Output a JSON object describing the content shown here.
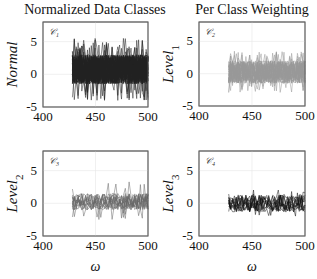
{
  "figure": {
    "titles": [
      "Normalized Data Classes",
      "Per Class Weighting"
    ]
  },
  "chart_data": [
    {
      "type": "line",
      "panel": "top-left",
      "title": "Normalized Data Classes",
      "annotation": "C1",
      "ylabel": "Normal",
      "ylabel_sub": "",
      "xlabel": "",
      "xlim": [
        400,
        500
      ],
      "ylim": [
        -5,
        8
      ],
      "xticks": [
        400,
        450,
        500
      ],
      "yticks": [
        -5,
        0,
        5
      ],
      "grid": true,
      "series_color": "#222222",
      "series_count": 60,
      "x_range": [
        428,
        500
      ],
      "band": {
        "low": -1.5,
        "high": 3.0
      },
      "outliers": {
        "max": 5.5,
        "min": -4.0
      }
    },
    {
      "type": "line",
      "panel": "top-right",
      "title": "Per Class Weighting",
      "annotation": "C2",
      "ylabel": "Level",
      "ylabel_sub": "1",
      "xlabel": "",
      "xlim": [
        400,
        500
      ],
      "ylim": [
        -5,
        8
      ],
      "xticks": [
        400,
        450,
        500
      ],
      "yticks": [
        -5,
        0,
        5
      ],
      "grid": true,
      "series_color": "#999999",
      "series_count": 40,
      "x_range": [
        428,
        500
      ],
      "band": {
        "low": -1.5,
        "high": 2.0
      },
      "outliers": {
        "max": 3.5,
        "min": -3.0
      }
    },
    {
      "type": "line",
      "panel": "bottom-left",
      "title": "",
      "annotation": "C3",
      "ylabel": "Level",
      "ylabel_sub": "2",
      "xlabel": "ω",
      "xlim": [
        400,
        500
      ],
      "ylim": [
        -5,
        8
      ],
      "xticks": [
        400,
        450,
        500
      ],
      "yticks": [
        -5,
        0,
        5
      ],
      "grid": true,
      "series_color": "#666666",
      "series_count": 14,
      "x_range": [
        428,
        500
      ],
      "band": {
        "low": -1.0,
        "high": 1.5
      },
      "outliers": {
        "max": 3.3,
        "min": -2.5
      }
    },
    {
      "type": "line",
      "panel": "bottom-right",
      "title": "",
      "annotation": "C4",
      "ylabel": "Level",
      "ylabel_sub": "3",
      "xlabel": "ω",
      "xlim": [
        400,
        500
      ],
      "ylim": [
        -5,
        8
      ],
      "xticks": [
        400,
        450,
        500
      ],
      "yticks": [
        -5,
        0,
        5
      ],
      "grid": true,
      "series_color": "#111111",
      "series_count": 12,
      "x_range": [
        428,
        500
      ],
      "band": {
        "low": -1.3,
        "high": 1.3
      },
      "outliers": {
        "max": 2.3,
        "min": -2.0
      }
    }
  ]
}
